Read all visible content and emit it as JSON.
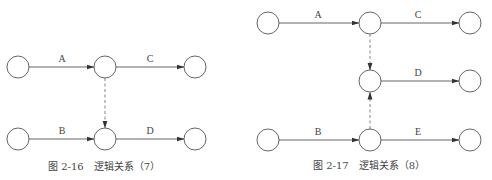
{
  "figures": [
    {
      "id": "fig-2-16",
      "caption": "图 2-16　逻辑关系（7）",
      "nodes": [
        {
          "id": "n1",
          "x": 18,
          "y": 67
        },
        {
          "id": "n2",
          "x": 105,
          "y": 67
        },
        {
          "id": "n3",
          "x": 195,
          "y": 67
        },
        {
          "id": "n4",
          "x": 18,
          "y": 139
        },
        {
          "id": "n5",
          "x": 105,
          "y": 139
        },
        {
          "id": "n6",
          "x": 195,
          "y": 139
        }
      ],
      "activities": [
        {
          "label": "A",
          "from": "n1",
          "to": "n2"
        },
        {
          "label": "C",
          "from": "n2",
          "to": "n3"
        },
        {
          "label": "B",
          "from": "n4",
          "to": "n5"
        },
        {
          "label": "D",
          "from": "n5",
          "to": "n6"
        }
      ],
      "dummy_activities": [
        {
          "from": "n2",
          "to": "n5"
        }
      ]
    },
    {
      "id": "fig-2-17",
      "caption": "图 2-17　逻辑关系（8）",
      "nodes": [
        {
          "id": "m1",
          "x": 268,
          "y": 23
        },
        {
          "id": "m2",
          "x": 370,
          "y": 23
        },
        {
          "id": "m3",
          "x": 470,
          "y": 23
        },
        {
          "id": "m4",
          "x": 370,
          "y": 81
        },
        {
          "id": "m5",
          "x": 470,
          "y": 81
        },
        {
          "id": "m6",
          "x": 268,
          "y": 140
        },
        {
          "id": "m7",
          "x": 370,
          "y": 140
        },
        {
          "id": "m8",
          "x": 470,
          "y": 140
        }
      ],
      "activities": [
        {
          "label": "A",
          "from": "m1",
          "to": "m2"
        },
        {
          "label": "C",
          "from": "m2",
          "to": "m3"
        },
        {
          "label": "D",
          "from": "m4",
          "to": "m5"
        },
        {
          "label": "B",
          "from": "m6",
          "to": "m7"
        },
        {
          "label": "E",
          "from": "m7",
          "to": "m8"
        }
      ],
      "dummy_activities": [
        {
          "from": "m2",
          "to": "m4"
        },
        {
          "from": "m7",
          "to": "m4"
        }
      ]
    }
  ]
}
